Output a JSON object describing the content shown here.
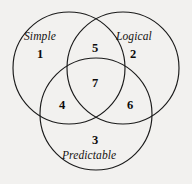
{
  "diagram": {
    "type": "venn-3-set",
    "background_color": "#f2f1ef",
    "stroke_color": "#1a1a1a",
    "sets": [
      {
        "id": "simple",
        "label": "Simple",
        "position": "left"
      },
      {
        "id": "logical",
        "label": "Logical",
        "position": "right"
      },
      {
        "id": "predictable",
        "label": "Predictable",
        "position": "bottom"
      }
    ],
    "regions": [
      {
        "id": "simple-only",
        "value": "1",
        "members": [
          "simple"
        ]
      },
      {
        "id": "logical-only",
        "value": "2",
        "members": [
          "logical"
        ]
      },
      {
        "id": "predictable-only",
        "value": "3",
        "members": [
          "predictable"
        ]
      },
      {
        "id": "simple-predictable",
        "value": "4",
        "members": [
          "simple",
          "predictable"
        ]
      },
      {
        "id": "simple-logical",
        "value": "5",
        "members": [
          "simple",
          "logical"
        ]
      },
      {
        "id": "logical-predictable",
        "value": "6",
        "members": [
          "logical",
          "predictable"
        ]
      },
      {
        "id": "all-three",
        "value": "7",
        "members": [
          "simple",
          "logical",
          "predictable"
        ]
      }
    ],
    "geometry": {
      "circle_radius": 56,
      "circles": [
        {
          "id": "simple",
          "cx": 69,
          "cy": 68
        },
        {
          "id": "logical",
          "cx": 123,
          "cy": 68
        },
        {
          "id": "predictable",
          "cx": 96,
          "cy": 114
        }
      ]
    }
  }
}
